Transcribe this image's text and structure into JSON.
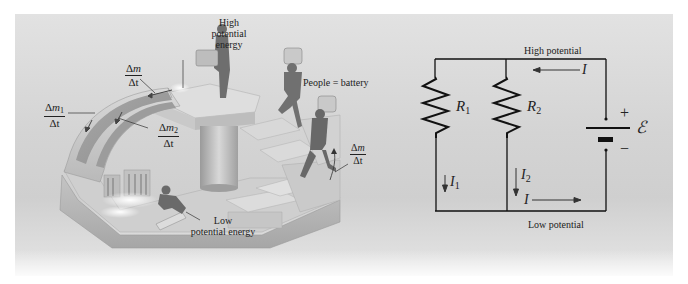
{
  "figure": {
    "left_panel": {
      "title": "Water-flow analogy",
      "labels": {
        "high_energy": [
          "High",
          "potential",
          "energy"
        ],
        "low_energy": [
          "Low",
          "potential energy"
        ],
        "people_battery": "People = battery"
      },
      "flow_rates": {
        "total": {
          "num_delta": "Δ",
          "num_var": "m",
          "num_sub": "",
          "den": "Δt"
        },
        "branch1": {
          "num_delta": "Δ",
          "num_var": "m",
          "num_sub": "1",
          "den": "Δt"
        },
        "branch2": {
          "num_delta": "Δ",
          "num_var": "m",
          "num_sub": "2",
          "den": "Δt"
        },
        "lift": {
          "num_delta": "Δ",
          "num_var": "m",
          "num_sub": "",
          "den": "Δt"
        }
      }
    },
    "circuit": {
      "high_potential": "High potential",
      "low_potential": "Low potential",
      "resistor1": {
        "sym": "R",
        "sub": "1"
      },
      "resistor2": {
        "sym": "R",
        "sub": "2"
      },
      "current_total_top": "I",
      "current_total_bottom": "I",
      "current1": {
        "sym": "I",
        "sub": "1"
      },
      "current2": {
        "sym": "I",
        "sub": "2"
      },
      "emf": "ℰ",
      "plus": "+",
      "minus": "−"
    }
  }
}
